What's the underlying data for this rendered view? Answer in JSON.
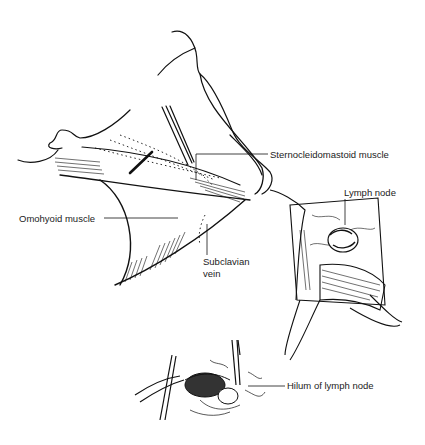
{
  "figure": {
    "type": "anatomical-illustration",
    "panels": [
      {
        "id": "neck-overview",
        "description": "Neck and shoulder with incision line across sternocleidomastoid region"
      },
      {
        "id": "surgical-field",
        "description": "Retracted incision exposing lymph node"
      },
      {
        "id": "node-excision",
        "description": "Forceps lifting lymph node, showing hilum"
      }
    ]
  },
  "labels": {
    "scm": "Sternocleidomastoid muscle",
    "omohyoid": "Omohyoid muscle",
    "subclavian_1": "Subclavian",
    "subclavian_2": "vein",
    "lymph_node": "Lymph node",
    "hilum": "Hilum of lymph node"
  },
  "colors": {
    "line": "#111111",
    "text": "#222222",
    "background": "#ffffff"
  }
}
